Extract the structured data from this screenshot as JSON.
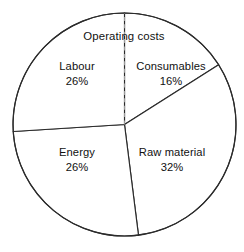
{
  "chart_data": {
    "type": "pie",
    "title": "Operating costs",
    "xlabel": "",
    "ylabel": "",
    "categories": [
      "Consumables",
      "Raw material",
      "Energy",
      "Labour"
    ],
    "values": [
      16,
      32,
      26,
      26
    ],
    "value_labels": [
      "16%",
      "32%",
      "26%",
      "26%"
    ],
    "unit": "%",
    "total": 100,
    "legend": "none",
    "grid": false,
    "start_angle_deg": 0,
    "direction": "clockwise",
    "slices": [
      {
        "name": "Consumables",
        "value": 16,
        "value_label": "16%",
        "start_deg": 0,
        "end_deg": 57.6,
        "label_x": 171,
        "label_y": 74,
        "fill": "#ffffff"
      },
      {
        "name": "Raw material",
        "value": 32,
        "value_label": "32%",
        "start_deg": 57.6,
        "end_deg": 172.8,
        "label_x": 172,
        "label_y": 160,
        "fill": "#ffffff"
      },
      {
        "name": "Energy",
        "value": 26,
        "value_label": "26%",
        "start_deg": 172.8,
        "end_deg": 266.4,
        "label_x": 77,
        "label_y": 160,
        "fill": "#ffffff"
      },
      {
        "name": "Labour",
        "value": 26,
        "value_label": "26%",
        "start_deg": 266.4,
        "end_deg": 360,
        "label_x": 77,
        "label_y": 74,
        "fill": "#ffffff"
      }
    ],
    "title_position": {
      "x": 124,
      "y": 36
    },
    "geometry": {
      "center_x": 124.5,
      "center_y": 124.5,
      "radius": 111.5
    },
    "style": {
      "background": "#ffffff",
      "outline_color": "#2b2b2b",
      "divider_color": "#2b2b2b",
      "dashed_divider_color": "#9a9a9a",
      "text_color": "#111111"
    },
    "dashed_divider_at_deg": 0
  }
}
